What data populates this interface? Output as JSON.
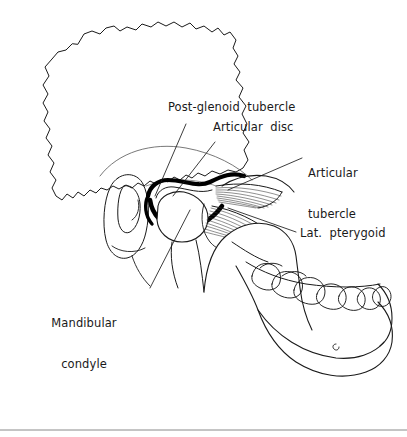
{
  "figure": {
    "title_visible": false,
    "style": "black-and-white anatomical line drawing",
    "background_color": "#ffffff",
    "line_color": "#1a1a1a"
  },
  "labels": [
    {
      "id": "post-glenoid-tubercle",
      "text": "Post-glenoid  tubercle",
      "x": 168,
      "y": 108,
      "align": "left",
      "leader": {
        "from": [
          186,
          124
        ],
        "to": [
          155,
          196
        ]
      }
    },
    {
      "id": "articular-disc",
      "text": "Articular  disc",
      "x": 213,
      "y": 128,
      "align": "left",
      "leader": {
        "from": [
          215,
          142
        ],
        "to": [
          173,
          196
        ]
      }
    },
    {
      "id": "articular-tubercle",
      "text": "Articular\ntubercle",
      "line1": "Articular",
      "line2": "tubercle",
      "x": 308,
      "y": 146,
      "align": "left",
      "leader": {
        "from": [
          302,
          158
        ],
        "to": [
          228,
          190
        ]
      }
    },
    {
      "id": "lat-pterygoid",
      "text": "Lat.  pterygoid",
      "x": 300,
      "y": 233,
      "align": "left",
      "leader": {
        "from": [
          296,
          232
        ],
        "to": [
          228,
          208
        ]
      }
    },
    {
      "id": "mandibular-condyle",
      "line1": "Mandibular",
      "line2": "condyle",
      "x": 84,
      "y": 296,
      "align": "center",
      "leader": {
        "from": [
          150,
          288
        ],
        "to": [
          190,
          210
        ]
      }
    }
  ],
  "structures": [
    {
      "id": "temporal-bone-outline",
      "name": "Temporal / parietal bone outline"
    },
    {
      "id": "external-auditory-meatus",
      "name": "External auditory meatus"
    },
    {
      "id": "articular-disc-shape",
      "name": "Articular disc (thick black band)"
    },
    {
      "id": "mandibular-condyle-head",
      "name": "Mandibular condyle head"
    },
    {
      "id": "lateral-pterygoid-superior",
      "name": "Superior head of lateral pterygoid"
    },
    {
      "id": "lateral-pterygoid-inferior",
      "name": "Inferior head of lateral pterygoid"
    },
    {
      "id": "mandible-ramus",
      "name": "Ramus of mandible"
    },
    {
      "id": "mandible-body",
      "name": "Body of mandible"
    },
    {
      "id": "teeth-arch",
      "name": "Mandibular teeth"
    },
    {
      "id": "mental-foramen",
      "name": "Mental foramen"
    },
    {
      "id": "bottom-rule",
      "name": "Horizontal separator rule"
    }
  ]
}
